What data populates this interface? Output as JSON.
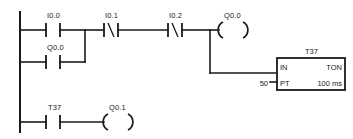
{
  "diagram": {
    "type": "ladder-logic",
    "title": "",
    "line_color": "#1a1a1a",
    "background": "#ffffff"
  },
  "rungs": [
    {
      "id": "rung-1",
      "elements": [
        {
          "kind": "contact-no",
          "label": "I0.0"
        },
        {
          "kind": "contact-nc",
          "label": "I0.1",
          "symbol": "/"
        },
        {
          "kind": "contact-nc",
          "label": "I0.2",
          "symbol": "/"
        },
        {
          "kind": "coil",
          "label": "Q0.0"
        }
      ]
    },
    {
      "id": "rung-1-branch",
      "elements": [
        {
          "kind": "contact-no",
          "label": "Q0.0"
        }
      ]
    },
    {
      "id": "rung-2",
      "elements": [
        {
          "kind": "contact-no",
          "label": "T37"
        },
        {
          "kind": "coil",
          "label": "Q0.1"
        }
      ]
    }
  ],
  "timer_block": {
    "name": "T37",
    "input_label": "IN",
    "type_label": "TON",
    "preset_input_label": "PT",
    "preset_value": "50",
    "time_base": "100 ms"
  }
}
